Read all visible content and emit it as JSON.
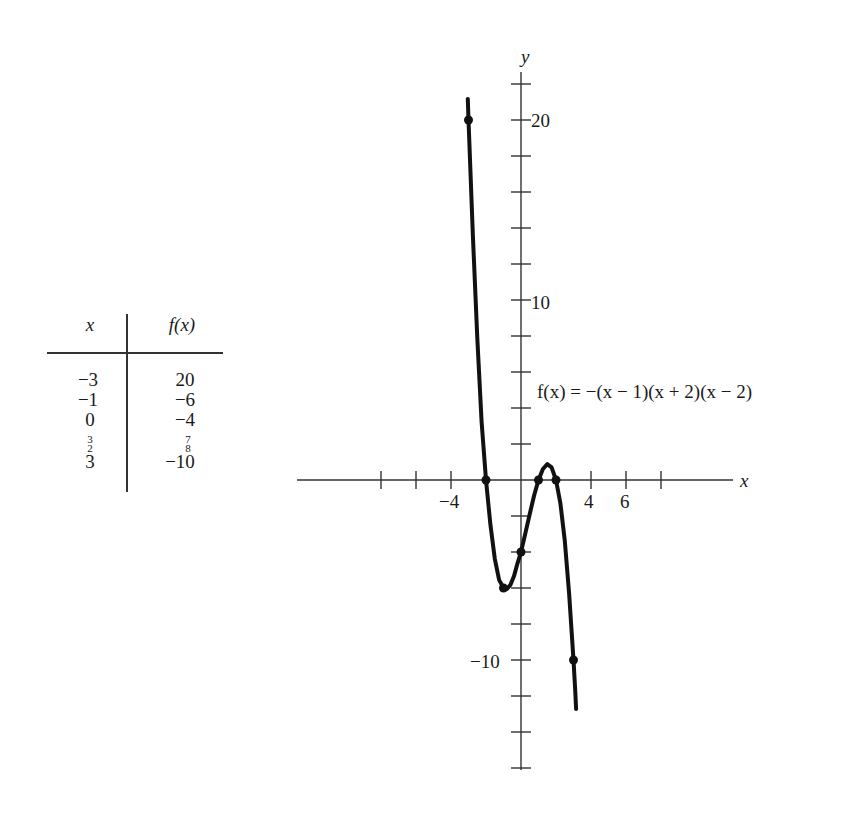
{
  "table": {
    "headers": [
      "x",
      "f(x)"
    ],
    "rows": [
      {
        "x": "−3",
        "fx": "20"
      },
      {
        "x": "−1",
        "fx": "−6"
      },
      {
        "x": "0",
        "fx": "−4"
      },
      {
        "x": {
          "num": "3",
          "den": "2"
        },
        "fx": {
          "num": "7",
          "den": "8"
        }
      },
      {
        "x": "3",
        "fx": "−10"
      }
    ]
  },
  "graph": {
    "equation": "f(x) = −(x − 1)(x + 2)(x − 2)",
    "x_axis_label": "x",
    "y_axis_label": "y",
    "x_tick_labels": [
      {
        "value": -4,
        "text": "−4"
      },
      {
        "value": 4,
        "text": "4"
      },
      {
        "value": 6,
        "text": "6"
      }
    ],
    "y_tick_labels": [
      {
        "value": 20,
        "text": "20"
      },
      {
        "value": 10,
        "text": "10"
      },
      {
        "value": -10,
        "text": "−10"
      }
    ]
  },
  "chart_data": {
    "type": "line",
    "title": "",
    "function": "f(x) = -(x - 1)(x + 2)(x - 2)",
    "xlabel": "x",
    "ylabel": "y",
    "xlim": [
      -13,
      12
    ],
    "ylim": [
      -16,
      23
    ],
    "x_ticks": [
      -8,
      -6,
      -4,
      -2,
      2,
      4,
      6,
      8
    ],
    "y_ticks": [
      -16,
      -14,
      -12,
      -10,
      -8,
      -6,
      -4,
      -2,
      2,
      4,
      6,
      8,
      10,
      12,
      14,
      16,
      18,
      20,
      22
    ],
    "grid": false,
    "legend": null,
    "marked_points": [
      {
        "x": -3,
        "y": 20
      },
      {
        "x": -2,
        "y": 0
      },
      {
        "x": -1,
        "y": -6
      },
      {
        "x": 0,
        "y": -4
      },
      {
        "x": 1,
        "y": 0
      },
      {
        "x": 2,
        "y": 0
      },
      {
        "x": 3,
        "y": -10
      }
    ],
    "series": [
      {
        "name": "f(x)",
        "x": [
          -3.04,
          -3,
          -2.75,
          -2.5,
          -2.25,
          -2,
          -1.75,
          -1.5,
          -1.25,
          -1,
          -0.8,
          -0.6,
          -0.4,
          -0.2,
          0,
          0.25,
          0.5,
          0.75,
          1,
          1.25,
          1.5,
          1.75,
          2,
          2.25,
          2.5,
          2.75,
          3,
          3.1,
          3.15
        ],
        "y": [
          21.17,
          20,
          13.55,
          7.88,
          3.23,
          0,
          -2.48,
          -4.38,
          -5.55,
          -6,
          -6.05,
          -5.82,
          -5.34,
          -4.63,
          -4,
          -2.95,
          -1.88,
          -0.86,
          0,
          0.61,
          0.88,
          0.7,
          0,
          -1.3,
          -3.38,
          -6.3,
          -10,
          -11.78,
          -12.72
        ]
      }
    ],
    "table": {
      "columns": [
        "x",
        "f(x)"
      ],
      "rows": [
        [
          -3,
          20
        ],
        [
          -1,
          -6
        ],
        [
          0,
          -4
        ],
        [
          1.5,
          0.875
        ],
        [
          3,
          -10
        ]
      ]
    }
  }
}
